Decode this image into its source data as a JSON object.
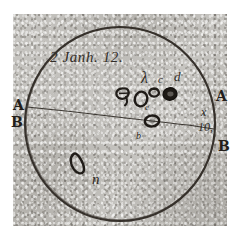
{
  "document": {
    "kind": "historical-astronomical-sunspot-drawing",
    "caption": "2 Janh. 12.",
    "caption_parts": {
      "day": "2",
      "month": "Janh.",
      "hour": "12."
    }
  },
  "disc": {
    "name": "solar-disc",
    "outline_color": "#241f1b",
    "center_x": 120,
    "center_y": 124,
    "radius_x": 95,
    "radius_y": 97
  },
  "diameter_line": {
    "name": "diameter-AB",
    "x1": 30,
    "y1": 108,
    "x2": 213,
    "y2": 129,
    "color": "#2b2722"
  },
  "edge_labels": [
    {
      "id": "A-left",
      "text": "A",
      "x": 18,
      "y": 104
    },
    {
      "id": "B-left",
      "text": "B",
      "x": 16,
      "y": 122
    },
    {
      "id": "A-right",
      "text": "A",
      "x": 219,
      "y": 96
    },
    {
      "id": "B-right",
      "text": "B",
      "x": 221,
      "y": 146
    }
  ],
  "margin_notes": [
    {
      "id": "note-x",
      "text": "x",
      "x": 203,
      "y": 112
    },
    {
      "id": "note-10",
      "text": "10,",
      "x": 200,
      "y": 126
    }
  ],
  "spot_labels": [
    {
      "id": "label-lambda",
      "text": "λ",
      "x": 145,
      "y": 80
    },
    {
      "id": "label-c-top",
      "text": "c",
      "x": 160,
      "y": 80
    },
    {
      "id": "label-d",
      "text": "d",
      "x": 176,
      "y": 78
    },
    {
      "id": "label-e",
      "text": "e",
      "x": 146,
      "y": 106
    },
    {
      "id": "label-b",
      "text": "b",
      "x": 138,
      "y": 136
    },
    {
      "id": "label-n",
      "text": "n",
      "x": 97,
      "y": 180
    }
  ],
  "sunspots": [
    {
      "id": "spot-lambda-group-left",
      "cx": 124,
      "cy": 95,
      "rx": 7,
      "ry": 8,
      "rot": -20
    },
    {
      "id": "spot-lambda-group-tail",
      "cx": 129,
      "cy": 101,
      "rx": 4,
      "ry": 4,
      "rot": 0
    },
    {
      "id": "spot-c",
      "cx": 140,
      "cy": 98,
      "rx": 6,
      "ry": 7,
      "rot": 12
    },
    {
      "id": "spot-d-small",
      "cx": 158,
      "cy": 92,
      "rx": 5,
      "ry": 5,
      "rot": -10
    },
    {
      "id": "spot-d-large",
      "cx": 171,
      "cy": 95,
      "rx": 7,
      "ry": 6,
      "rot": 8
    },
    {
      "id": "spot-b-on-line",
      "cx": 152,
      "cy": 121,
      "rx": 7,
      "ry": 5,
      "rot": -5
    },
    {
      "id": "spot-n-elongated",
      "cx": 78,
      "cy": 163,
      "rx": 5,
      "ry": 11,
      "rot": 28
    }
  ],
  "colors": {
    "paper": "#b9b7b2",
    "ink": "#241f1b",
    "page_background": "#ffffff"
  }
}
